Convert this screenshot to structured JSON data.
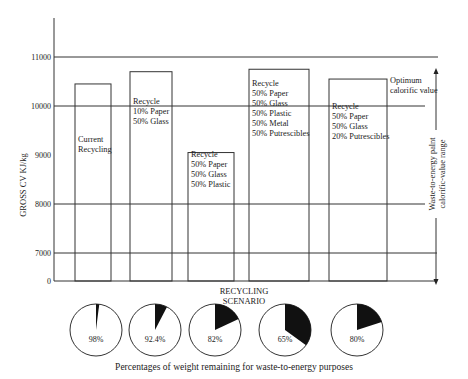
{
  "chart_data": [
    {
      "type": "bar",
      "title": "",
      "xlabel": "RECYCLING\nSCENARIO",
      "xlabel_lines": [
        "RECYCLING",
        "SCENARIO"
      ],
      "ylabel": "GROSS CV KJ/kg",
      "yticks": [
        0,
        7000,
        8000,
        9000,
        10000,
        11000
      ],
      "ytick_labels": [
        "0",
        "7000",
        "8000",
        "9000",
        "10000",
        "11000"
      ],
      "gridlines": [
        7000,
        8000,
        10000,
        11000
      ],
      "axis_break": true,
      "categories": [
        [
          "Current",
          "Recycling"
        ],
        [
          "Recycle",
          "10% Paper",
          "50% Glass"
        ],
        [
          "Recycle",
          "50% Paper",
          "50% Glass",
          "50% Plastic"
        ],
        [
          "Recycle",
          "50% Paper",
          "50% Glass",
          "50% Plastic",
          "50% Metal",
          "50% Putrescibles"
        ],
        [
          "Recycle",
          "50% Paper",
          "50% Glass",
          "20% Putrescibles"
        ]
      ],
      "values": [
        10450,
        10700,
        9050,
        10750,
        10550
      ],
      "annotations": {
        "optimum": [
          "Optimum",
          "calorific value"
        ],
        "range": [
          "Waste-to-energy palnt",
          "calorific-value range"
        ]
      }
    },
    {
      "type": "pie",
      "title": "Percentages of weight remaining for waste-to-energy purposes",
      "values": [
        98,
        92.4,
        82,
        65,
        80
      ],
      "labels": [
        "98%",
        "92.4%",
        "82%",
        "65%",
        "80%"
      ]
    }
  ]
}
